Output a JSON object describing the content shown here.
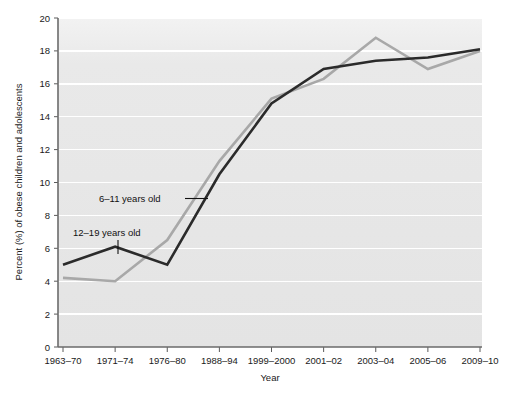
{
  "chart_data": {
    "type": "line",
    "title": "",
    "xlabel": "Year",
    "ylabel": "Percent (%) of obese children and adolescents",
    "categories": [
      "1963–70",
      "1971–74",
      "1976–80",
      "1988–94",
      "1999–2000",
      "2001–02",
      "2003–04",
      "2005–06",
      "2009–10"
    ],
    "series": [
      {
        "name": "12–19 years old",
        "color": "#2b2b2b",
        "values": [
          5.0,
          6.1,
          5.0,
          10.5,
          14.8,
          16.9,
          17.4,
          17.6,
          18.1
        ]
      },
      {
        "name": "6–11 years old",
        "color": "#a8a8a8",
        "values": [
          4.2,
          4.0,
          6.5,
          11.3,
          15.1,
          16.3,
          18.8,
          16.9,
          18.0
        ]
      }
    ],
    "ylim": [
      0,
      20
    ],
    "yticks": [
      0,
      2,
      4,
      6,
      8,
      10,
      12,
      14,
      16,
      18,
      20
    ],
    "ytick_labels": [
      "0",
      "2",
      "4",
      "6",
      "8",
      "10",
      "12",
      "14",
      "16",
      "18",
      "20"
    ],
    "grid": "horizontal-only",
    "grid_color": "#ffffff",
    "plot_background": "#e6e6e6",
    "legend_position": "inline-annotations",
    "annotations": [
      {
        "text": "6–11 years old",
        "leader": "horizontal"
      },
      {
        "text": "12–19 years old",
        "leader": "vertical"
      }
    ]
  },
  "axis": {
    "x_title": "Year",
    "y_title": "Percent (%) of obese children and adolescents"
  }
}
